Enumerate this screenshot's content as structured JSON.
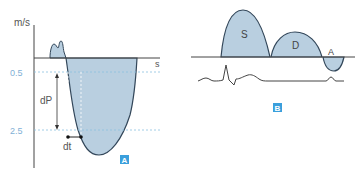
{
  "panel_a": {
    "y_unit": "m/s",
    "x_unit": "s",
    "tick_top": "0.5",
    "tick_bottom": "2.5",
    "interval_label": "dP",
    "time_label": "dt",
    "badge": "A"
  },
  "panel_b": {
    "wave_s": "S",
    "wave_d": "D",
    "wave_a": "A",
    "badge": "B"
  },
  "colors": {
    "fill": "#b9cfe0",
    "stroke": "#33475a",
    "tick_text": "#7fb0d6",
    "badge_bg": "#3a9fdc",
    "guide": "#8cc0e0"
  }
}
